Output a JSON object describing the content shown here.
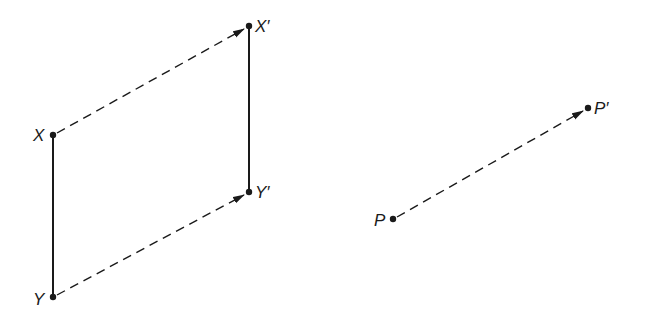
{
  "diagram": {
    "type": "translation",
    "colors": {
      "ink": "#1a1a1a",
      "background": "#ffffff"
    },
    "points": {
      "X": {
        "label": "X",
        "x": 53,
        "y": 135
      },
      "Xp": {
        "label": "X′",
        "x": 249,
        "y": 26
      },
      "Y": {
        "label": "Y",
        "x": 53,
        "y": 297
      },
      "Yp": {
        "label": "Y′",
        "x": 249,
        "y": 192
      },
      "P": {
        "label": "P",
        "x": 393,
        "y": 219
      },
      "Pp": {
        "label": "P′",
        "x": 588,
        "y": 108
      }
    },
    "segments": [
      {
        "from": "X",
        "to": "Y",
        "style": "solid"
      },
      {
        "from": "Xp",
        "to": "Yp",
        "style": "solid"
      }
    ],
    "arrows": [
      {
        "from": "X",
        "to": "Xp",
        "style": "dashed"
      },
      {
        "from": "Y",
        "to": "Yp",
        "style": "dashed"
      },
      {
        "from": "P",
        "to": "Pp",
        "style": "dashed"
      }
    ]
  }
}
